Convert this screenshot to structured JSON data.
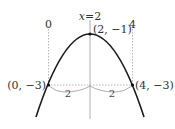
{
  "diagram": {
    "axis_label": "x=2",
    "axis_label_var": "x",
    "axis_label_rest": "=2",
    "tick_left": "0",
    "tick_right": "4",
    "vertex_label": "(2, −1)",
    "left_point_label": "(0, −3)",
    "right_point_label": "(4, −3)",
    "left_distance": "2",
    "right_distance": "2",
    "colors": {
      "curve": "#1a1a1a",
      "guides": "#888888",
      "text": "#333333"
    }
  }
}
